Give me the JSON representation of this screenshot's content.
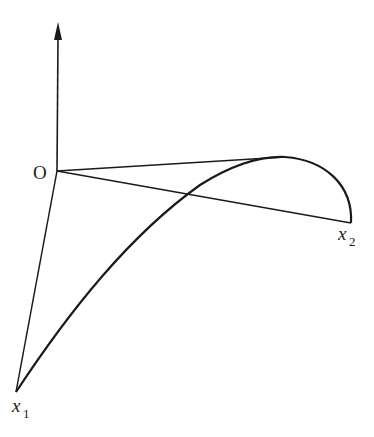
{
  "diagram": {
    "colors": {
      "stroke": "#1a1a1a",
      "background": "#ffffff",
      "text": "#222222"
    },
    "labels": {
      "origin": "O",
      "x1_base": "x",
      "x1_sub": "1",
      "x2_base": "x",
      "x2_sub": "2"
    },
    "points": {
      "origin": [
        57,
        171
      ],
      "axis_tip": [
        58,
        22
      ],
      "peak": [
        285,
        157
      ],
      "x1": [
        16,
        392
      ],
      "x2": [
        351,
        223
      ]
    }
  }
}
